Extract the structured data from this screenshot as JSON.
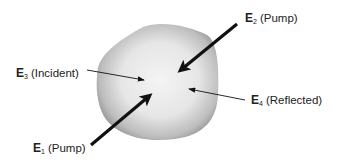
{
  "diagram": {
    "type": "four-wave-mixing-schematic",
    "object": {
      "name": "nonlinear-medium",
      "fill_center": "#f2f2f2",
      "fill_edge": "#9a9a9a"
    },
    "beams": [
      {
        "id": "E1",
        "symbol": "E",
        "subscript": "1",
        "role": "(Pump)",
        "arrow": "thick"
      },
      {
        "id": "E2",
        "symbol": "E",
        "subscript": "2",
        "role": "(Pump)",
        "arrow": "thick"
      },
      {
        "id": "E3",
        "symbol": "E",
        "subscript": "3",
        "role": "(Incident)",
        "arrow": "thin"
      },
      {
        "id": "E4",
        "symbol": "E",
        "subscript": "4",
        "role": "(Reflected)",
        "arrow": "thin"
      }
    ],
    "colors": {
      "arrow": "#111111",
      "text": "#222222",
      "background": "#ffffff"
    }
  }
}
